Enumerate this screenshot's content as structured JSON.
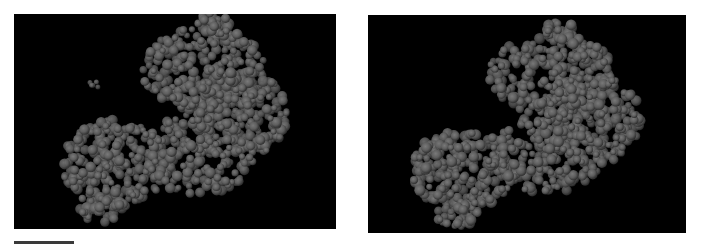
{
  "figure": {
    "background_color": "#ffffff",
    "panel_color": "#000000",
    "atom_color": "#5e5e5e",
    "atom_edge_color": "#2a2a2a"
  },
  "panels": [
    {
      "name": "left-stereo-view",
      "label": "Left view",
      "seed": 11,
      "blobs": [
        {
          "cx": 190,
          "cy": 55,
          "rx": 62,
          "ry": 42,
          "n": 260
        },
        {
          "cx": 225,
          "cy": 100,
          "rx": 48,
          "ry": 45,
          "n": 200
        },
        {
          "cx": 185,
          "cy": 140,
          "rx": 55,
          "ry": 40,
          "n": 200
        },
        {
          "cx": 100,
          "cy": 150,
          "rx": 52,
          "ry": 45,
          "n": 240
        },
        {
          "cx": 200,
          "cy": 10,
          "rx": 16,
          "ry": 12,
          "n": 30
        },
        {
          "cx": 85,
          "cy": 196,
          "rx": 25,
          "ry": 14,
          "n": 40
        }
      ],
      "islands": [
        {
          "cx": 80,
          "cy": 70,
          "rx": 6,
          "ry": 5,
          "n": 5
        }
      ]
    },
    {
      "name": "right-stereo-view",
      "label": "Right view",
      "seed": 23,
      "blobs": [
        {
          "cx": 185,
          "cy": 60,
          "rx": 65,
          "ry": 40,
          "n": 260
        },
        {
          "cx": 225,
          "cy": 105,
          "rx": 48,
          "ry": 45,
          "n": 200
        },
        {
          "cx": 180,
          "cy": 140,
          "rx": 55,
          "ry": 40,
          "n": 200
        },
        {
          "cx": 95,
          "cy": 155,
          "rx": 52,
          "ry": 40,
          "n": 240
        },
        {
          "cx": 190,
          "cy": 15,
          "rx": 18,
          "ry": 10,
          "n": 30
        },
        {
          "cx": 90,
          "cy": 200,
          "rx": 22,
          "ry": 12,
          "n": 35
        }
      ],
      "islands": []
    }
  ],
  "scale_bar": {
    "label": "scale bar",
    "length_px": 60
  }
}
